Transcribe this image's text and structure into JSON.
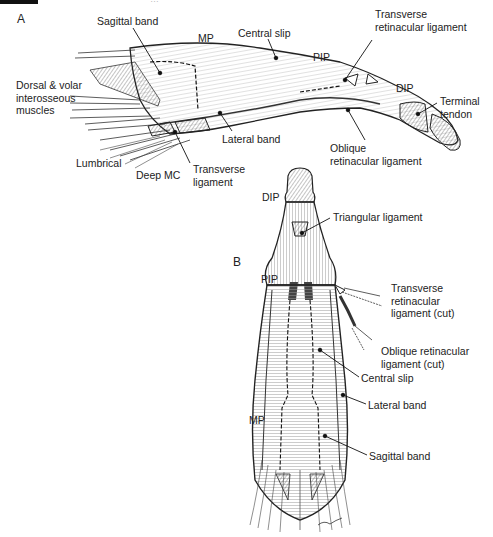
{
  "header": {
    "text": "…"
  },
  "figure": {
    "panel_a": {
      "letter": "A",
      "labels": [
        {
          "id": "sagittal-band",
          "text": "Sagittal band",
          "x": 97,
          "y": 15
        },
        {
          "id": "mp",
          "text": "MP",
          "x": 198,
          "y": 32
        },
        {
          "id": "central-slip",
          "text": "Central slip",
          "x": 238,
          "y": 27
        },
        {
          "id": "pip",
          "text": "PIP",
          "x": 313,
          "y": 51
        },
        {
          "id": "transverse-retinacular-ligament",
          "text": "Transverse\nretinacular ligament",
          "x": 375,
          "y": 8
        },
        {
          "id": "dip",
          "text": "DIP",
          "x": 396,
          "y": 82
        },
        {
          "id": "terminal-tendon",
          "text": "Terminal\ntendon",
          "x": 440,
          "y": 95
        },
        {
          "id": "dorsal-volar-interosseous",
          "text": "Dorsal & volar\ninterosseous\nmuscles",
          "x": 16,
          "y": 79
        },
        {
          "id": "oblique-retinacular-ligament",
          "text": "Oblique\nretinacular ligament",
          "x": 330,
          "y": 142
        },
        {
          "id": "lateral-band",
          "text": "Lateral band",
          "x": 222,
          "y": 133
        },
        {
          "id": "lumbrical",
          "text": "Lumbrical",
          "x": 76,
          "y": 157
        },
        {
          "id": "deep-mc",
          "text": "Deep MC",
          "x": 136,
          "y": 169
        },
        {
          "id": "transverse-ligament",
          "text": "Transverse\nligament",
          "x": 193,
          "y": 163
        }
      ]
    },
    "panel_b": {
      "letter": "B",
      "labels": [
        {
          "id": "dip",
          "text": "DIP",
          "x": 262,
          "y": 191
        },
        {
          "id": "triangular-ligament",
          "text": "Triangular ligament",
          "x": 333,
          "y": 211
        },
        {
          "id": "pip",
          "text": "PIP",
          "x": 261,
          "y": 273
        },
        {
          "id": "transverse-retinacular-ligament-cut",
          "text": "Transverse\nretinacular\nligament (cut)",
          "x": 391,
          "y": 282
        },
        {
          "id": "oblique-retinacular-ligament-cut",
          "text": "Oblique retinacular\nligament (cut)",
          "x": 381,
          "y": 345
        },
        {
          "id": "central-slip",
          "text": "Central slip",
          "x": 361,
          "y": 372
        },
        {
          "id": "mp",
          "text": "MP",
          "x": 249,
          "y": 414
        },
        {
          "id": "lateral-band",
          "text": "Lateral band",
          "x": 368,
          "y": 399
        },
        {
          "id": "sagittal-band",
          "text": "Sagittal band",
          "x": 369,
          "y": 450
        }
      ]
    }
  }
}
